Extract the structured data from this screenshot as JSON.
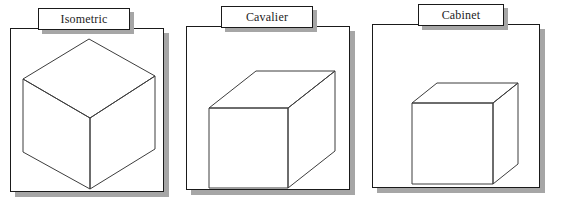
{
  "figure": {
    "background_color": "#ffffff",
    "line_color": "#3d3d3d",
    "border_color": "#1a1a1a",
    "shadow_color": "#a6a6a6",
    "width": 561,
    "height": 216
  },
  "panels": [
    {
      "id": "isometric",
      "label": "Isometric",
      "frame": {
        "x": 10,
        "y": 28,
        "w": 154,
        "h": 164
      },
      "shadow_offset": {
        "x": 5,
        "y": 5
      },
      "label_box": {
        "x": 38,
        "y": 8,
        "w": 92,
        "h": 22
      },
      "drawing": {
        "type": "isometric-cube",
        "points": {
          "top_apex": [
            89,
            39
          ],
          "left": [
            23,
            79
          ],
          "right": [
            155,
            76
          ],
          "center": [
            90,
            118
          ],
          "bottom_left": [
            23,
            152
          ],
          "bottom_right": [
            155,
            149
          ],
          "bottom_apex": [
            90,
            189
          ]
        }
      }
    },
    {
      "id": "cavalier",
      "label": "Cavalier",
      "frame": {
        "x": 186,
        "y": 26,
        "w": 164,
        "h": 164
      },
      "shadow_offset": {
        "x": 5,
        "y": 5
      },
      "label_box": {
        "x": 221,
        "y": 6,
        "w": 92,
        "h": 22
      },
      "drawing": {
        "type": "oblique-box",
        "front_face": {
          "x": 209,
          "y": 108,
          "w": 79,
          "h": 80
        },
        "depth_offset": {
          "x": 47,
          "y": -37
        }
      }
    },
    {
      "id": "cabinet",
      "label": "Cabinet",
      "frame": {
        "x": 372,
        "y": 24,
        "w": 168,
        "h": 164
      },
      "shadow_offset": {
        "x": 5,
        "y": 5
      },
      "label_box": {
        "x": 418,
        "y": 4,
        "w": 86,
        "h": 22
      },
      "drawing": {
        "type": "oblique-box",
        "front_face": {
          "x": 412,
          "y": 103,
          "w": 81,
          "h": 81
        },
        "depth_offset": {
          "x": 25,
          "y": -20
        }
      }
    }
  ]
}
